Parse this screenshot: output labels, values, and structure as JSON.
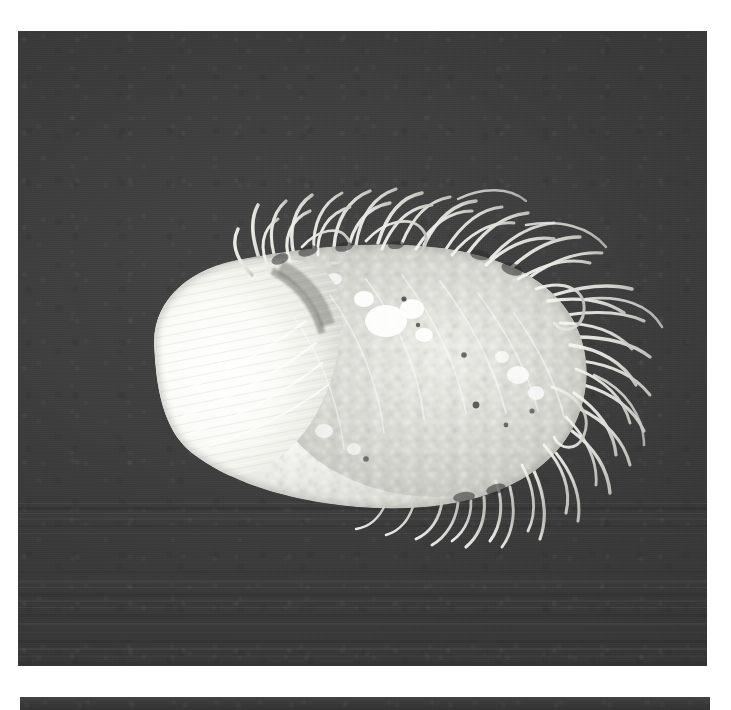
{
  "page": {
    "background_color": "#ffffff",
    "width": 731,
    "height": 710
  },
  "plates": [
    {
      "id": "main",
      "name": "primary-micrograph",
      "caption": "",
      "frame": {
        "x": 18,
        "y": 31,
        "width": 689,
        "height": 635
      },
      "background_color": "#3b3b3b",
      "description": "Grayscale micrograph on a dark grainy field"
    },
    {
      "id": "strip",
      "name": "lower-plate-edge",
      "caption": "",
      "frame": {
        "x": 20,
        "y": 697,
        "width": 690,
        "height": 13
      },
      "background_color": "#3b3b3b",
      "description": "Top sliver of the following micrograph plate"
    }
  ],
  "subject": {
    "name": "hairy-ovoid-specimen",
    "label": "",
    "body_color": "#e8e8e4",
    "highlight_color": "#fdfdfb",
    "shadow_color": "#9a9a96",
    "filament_color": "#efefea",
    "orientation": "horizontal, smooth pointed pole at left, setae-bearing pole at right",
    "regions": [
      {
        "name": "smooth-anterior-lobe",
        "note": "bright, finely striated, pointed to the left"
      },
      {
        "name": "granular-posterior-body",
        "note": "crusty, speckled, mid-gray granules and bright clumps"
      },
      {
        "name": "setae-fringe",
        "note": "dense curved hair-like filaments radiating from upper and right margins"
      }
    ]
  },
  "colors": {
    "plate_background": "#3b3b3b",
    "page_background": "#ffffff",
    "specimen_light": "#fbfbf8",
    "specimen_mid": "#d6d6d1",
    "specimen_dark": "#8f8f8a"
  }
}
